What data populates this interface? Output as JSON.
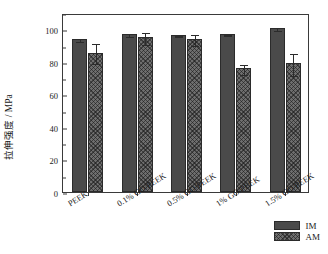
{
  "chart_data": {
    "type": "bar",
    "title": "",
    "xlabel": "",
    "ylabel": "拉伸强度 / MPa",
    "ylim": [
      0,
      110
    ],
    "yticks": [
      0,
      20,
      40,
      60,
      80,
      100
    ],
    "ytick_labels": [
      "0",
      "20",
      "40",
      "60",
      "80",
      "100"
    ],
    "minor_ticks": true,
    "grid": false,
    "legend_position": "bottom-right",
    "categories": [
      "PEEK",
      "0.1% GO/PEEK",
      "0.5% GO/PEEK",
      "1% GO/PEEK",
      "1.5% GO/PEEK"
    ],
    "series": [
      {
        "name": "IM",
        "color": "#4a4a4a",
        "pattern": "solid",
        "values": [
          94,
          97,
          96.5,
          97,
          101
        ],
        "errors": [
          1.0,
          1.2,
          0.8,
          0.8,
          1.2
        ]
      },
      {
        "name": "AM",
        "color": "#6e6e6e",
        "pattern": "crosshatch",
        "values": [
          85.5,
          95,
          94,
          76,
          79
        ],
        "errors": [
          6.5,
          4.0,
          3.5,
          3.5,
          7.0
        ]
      }
    ]
  },
  "legend": {
    "entries": [
      {
        "label": "IM"
      },
      {
        "label": "AM"
      }
    ]
  },
  "axis": {
    "y_label": "拉伸强度 / MPa",
    "y_tick_0": "0",
    "y_tick_1": "20",
    "y_tick_2": "40",
    "y_tick_3": "60",
    "y_tick_4": "80",
    "y_tick_5": "100"
  },
  "colors": {
    "im_fill": "#4a4a4a",
    "am_fill": "#6e6e6e",
    "axis": "#3a3a3a",
    "background": "#ffffff"
  }
}
